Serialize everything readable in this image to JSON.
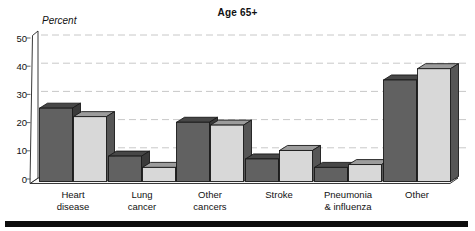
{
  "title": "Age 65+",
  "y_axis_label": "Percent",
  "chart_data": {
    "type": "bar",
    "style": "3d-grouped-bars",
    "title": "Age 65+",
    "ylabel": "Percent",
    "xlabel": "",
    "ylim": [
      0,
      50
    ],
    "yticks": [
      0,
      10,
      20,
      30,
      40,
      50
    ],
    "grid": "horizontal-dashed",
    "legend_position": "none",
    "categories": [
      "Heart disease",
      "Lung cancer",
      "Other cancers",
      "Stroke",
      "Pneumonia & influenza",
      "Other"
    ],
    "category_label_lines": [
      [
        "Heart",
        "disease"
      ],
      [
        "Lung",
        "cancer"
      ],
      [
        "Other",
        "cancers"
      ],
      [
        "Stroke"
      ],
      [
        "Pneumonia",
        "& influenza"
      ],
      [
        "Other"
      ]
    ],
    "series": [
      {
        "name": "dark-gray-bars",
        "values": [
          26,
          9,
          21,
          8,
          5,
          36
        ]
      },
      {
        "name": "light-gray-bars",
        "values": [
          23,
          5,
          20,
          11,
          6,
          40
        ]
      }
    ]
  },
  "colors": {
    "dark_front": "#616161",
    "dark_top": "#474747",
    "dark_side": "#3a3a3a",
    "light_front": "#d8d8d8",
    "light_top": "#9c9c9c",
    "light_side": "#565656",
    "outline": "#1a1a1a",
    "gridline": "#c8c8c8",
    "axis": "#222222",
    "floor_fill": "#f7f7f7",
    "wall_fill": "#ffffff",
    "rule": "#0d0d0d"
  }
}
